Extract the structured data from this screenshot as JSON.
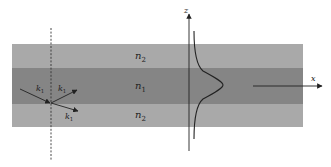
{
  "diagram": {
    "colors": {
      "background": "#ffffff",
      "cladding": "#a9a9a9",
      "core": "#858585",
      "line": "#222222"
    },
    "layers": [
      {
        "id": "cladding-top",
        "label_base": "n",
        "label_sub": "2"
      },
      {
        "id": "core",
        "label_base": "n",
        "label_sub": "1"
      },
      {
        "id": "cladding-bottom",
        "label_base": "n",
        "label_sub": "2"
      }
    ],
    "wave_vectors": [
      {
        "id": "incident",
        "label_base": "k",
        "label_sub": "1"
      },
      {
        "id": "reflected",
        "label_base": "k",
        "label_sub": "1"
      },
      {
        "id": "transmitted",
        "label_base": "k",
        "label_sub": "1"
      }
    ],
    "axes": {
      "z": {
        "label": "z"
      },
      "x": {
        "label": "x"
      }
    },
    "normal_line": {
      "style": "dashed"
    },
    "field_profile": {
      "shape": "gaussian-like mode peaked at core center"
    }
  }
}
